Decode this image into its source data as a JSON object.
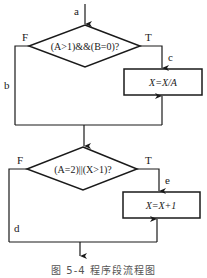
{
  "diagram": {
    "type": "flowchart",
    "entry_label": "a",
    "decision1": {
      "condition": "(A>1)&&(B=0)?",
      "true_label": "T",
      "false_label": "F",
      "false_path_label": "b",
      "true_path_label": "c"
    },
    "process1": {
      "text": "X=X/A"
    },
    "decision2": {
      "condition": "(A=2)||(X>1)?",
      "true_label": "T",
      "false_label": "F",
      "false_path_label": "d",
      "true_path_label": "e"
    },
    "process2": {
      "text": "X=X+1"
    },
    "caption": "图 5-4  程序段流程图"
  }
}
